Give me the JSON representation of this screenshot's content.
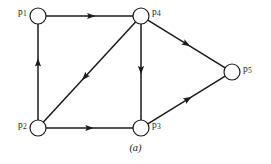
{
  "figure": {
    "caption": "(a)",
    "type": "directed-graph",
    "stroke_color": "#1a1a1a",
    "node_fill_color": "#ffffff",
    "background_color": "#ffffff"
  },
  "nodes": [
    {
      "id": "p1",
      "base": "p",
      "sub": "1",
      "cx": 38,
      "cy": 16,
      "r": 8,
      "label_x": 18,
      "label_y": 8,
      "label": "p1"
    },
    {
      "id": "p2",
      "base": "p",
      "sub": "2",
      "cx": 38,
      "cy": 128,
      "r": 8,
      "label_x": 18,
      "label_y": 121,
      "label": "p2"
    },
    {
      "id": "p3",
      "base": "p",
      "sub": "3",
      "cx": 141,
      "cy": 128,
      "r": 8,
      "label_x": 152,
      "label_y": 121,
      "label": "p3"
    },
    {
      "id": "p4",
      "base": "p",
      "sub": "4",
      "cx": 141,
      "cy": 16,
      "r": 8,
      "label_x": 152,
      "label_y": 8,
      "label": "p4"
    },
    {
      "id": "p5",
      "base": "p",
      "sub": "5",
      "cx": 232,
      "cy": 72,
      "r": 8,
      "label_x": 243,
      "label_y": 65,
      "label": "p5"
    }
  ],
  "edges": [
    {
      "id": "p1-p4",
      "from": "p1",
      "to": "p4",
      "direction": "right",
      "arrow_t": 0.52
    },
    {
      "id": "p2-p1",
      "from": "p2",
      "to": "p1",
      "direction": "up",
      "arrow_t": 0.6
    },
    {
      "id": "p4-p2",
      "from": "p4",
      "to": "p2",
      "direction": "down-left",
      "arrow_t": 0.55
    },
    {
      "id": "p4-p3",
      "from": "p4",
      "to": "p3",
      "direction": "down",
      "arrow_t": 0.48
    },
    {
      "id": "p4-p5",
      "from": "p4",
      "to": "p5",
      "direction": "down-right",
      "arrow_t": 0.5
    },
    {
      "id": "p2-p3",
      "from": "p2",
      "to": "p3",
      "direction": "right",
      "arrow_t": 0.5
    },
    {
      "id": "p3-p5",
      "from": "p3",
      "to": "p5",
      "direction": "up-right",
      "arrow_t": 0.52
    }
  ]
}
